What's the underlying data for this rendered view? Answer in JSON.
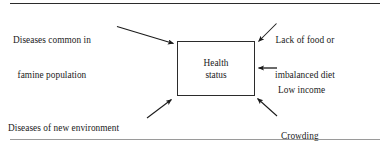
{
  "figure": {
    "type": "influence-diagram",
    "center_box": {
      "label_line1": "Health",
      "label_line2": "status"
    },
    "factors": [
      {
        "id": "famine",
        "line1": "Diseases common in",
        "line2": "famine population",
        "arrow_direction": "down-right",
        "position": "top-left"
      },
      {
        "id": "food",
        "line1": "Lack of food or",
        "line2": "imbalanced diet",
        "arrow_direction": "down-left",
        "position": "top-right"
      },
      {
        "id": "income",
        "line1": "Low income",
        "line2": "",
        "arrow_direction": "left",
        "position": "right"
      },
      {
        "id": "migrating",
        "line1": "Diseases of new environment",
        "line2": "if migrating",
        "arrow_direction": "up-right",
        "position": "bottom-left"
      },
      {
        "id": "crowding",
        "line1": "Crowding",
        "line2": "",
        "arrow_direction": "up-left",
        "position": "bottom-right"
      }
    ],
    "rules": {
      "top_visible": true,
      "bottom_visible": true
    },
    "colors": {
      "ink": "#1a1a1a",
      "rule_top": "#2b2b2b",
      "rule_bottom": "#9a9a9a",
      "background": "#ffffff"
    }
  }
}
